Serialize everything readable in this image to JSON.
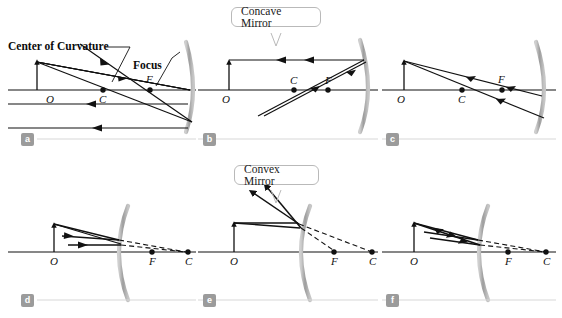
{
  "figure": {
    "title_hidden": "",
    "background_color": "#ffffff",
    "ray_color": "#111111",
    "mirror_color": "#a9a9a9",
    "axis_color": "#111111",
    "badge_color": "#9b9b9b",
    "rule_color": "#d8d8d8"
  },
  "callouts": [
    {
      "id": "concave",
      "label": "Concave Mirror"
    },
    {
      "id": "convex",
      "label": "Convex Mirror"
    }
  ],
  "annotations": [
    {
      "id": "center-of-curvature",
      "label": "Center of Curvature"
    },
    {
      "id": "focus",
      "label": "Focus"
    }
  ],
  "panels": [
    {
      "id": "a",
      "badge": "a",
      "mirror_type": "concave",
      "point_labels": [
        "O",
        "C",
        "F"
      ]
    },
    {
      "id": "b",
      "badge": "b",
      "mirror_type": "concave",
      "point_labels": [
        "O",
        "C",
        "F"
      ]
    },
    {
      "id": "c",
      "badge": "c",
      "mirror_type": "concave",
      "point_labels": [
        "O",
        "C",
        "F"
      ]
    },
    {
      "id": "d",
      "badge": "d",
      "mirror_type": "convex",
      "point_labels": [
        "O",
        "F",
        "C"
      ]
    },
    {
      "id": "e",
      "badge": "e",
      "mirror_type": "convex",
      "point_labels": [
        "O",
        "F",
        "C"
      ]
    },
    {
      "id": "f",
      "badge": "f",
      "mirror_type": "convex",
      "point_labels": [
        "O",
        "F",
        "C"
      ]
    }
  ]
}
